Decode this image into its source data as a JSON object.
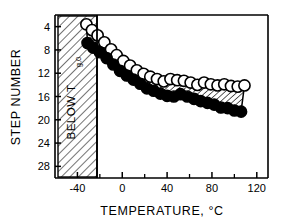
{
  "chart_data": {
    "type": "scatter",
    "title": "",
    "xlabel": "TEMPERATURE, °C",
    "ylabel": "STEP NUMBER",
    "xlim": [
      -60,
      130
    ],
    "ylim": [
      30,
      2
    ],
    "y_axis_inverted": true,
    "grid": false,
    "legend": "none",
    "xticks": [
      -40,
      0,
      40,
      80,
      120
    ],
    "xtick_labels": [
      "-40",
      "0",
      "40",
      "80",
      "120"
    ],
    "xticks_minor": [
      -20,
      20,
      60,
      100
    ],
    "yticks": [
      4,
      8,
      12,
      16,
      20,
      24,
      28
    ],
    "ytick_labels": [
      "4",
      "8",
      "12",
      "16",
      "20",
      "24",
      "28"
    ],
    "annotations": [
      {
        "text": "BELOW T",
        "subscript": "g,0",
        "orientation": "vertical",
        "region": "hatched",
        "x_range": [
          -60,
          -40
        ]
      }
    ],
    "series": [
      {
        "name": "upper-bound-open-circles",
        "marker": "open-circle",
        "x": [
          -32,
          -27,
          -22,
          -16,
          -10,
          -5,
          1,
          7,
          13,
          19,
          25,
          31,
          37,
          43,
          49,
          55,
          61,
          67,
          73,
          79,
          85,
          91,
          97,
          103,
          109
        ],
        "y": [
          3.6,
          4.6,
          5.5,
          6.7,
          7.9,
          8.9,
          9.9,
          10.7,
          11.5,
          12.1,
          12.6,
          13.0,
          13.4,
          13.0,
          13.2,
          13.3,
          13.6,
          14.0,
          13.6,
          13.9,
          14.1,
          13.9,
          14.2,
          14.3,
          14.1
        ]
      },
      {
        "name": "lower-bound-filled-circles",
        "marker": "filled-circle",
        "x": [
          -31,
          -26,
          -20,
          -14,
          -8,
          -2,
          4,
          10,
          16,
          22,
          28,
          34,
          40,
          46,
          52,
          58,
          64,
          70,
          76,
          82,
          88,
          94,
          100,
          106
        ],
        "y": [
          6.8,
          7.6,
          8.4,
          9.4,
          10.5,
          11.6,
          12.4,
          13.1,
          13.8,
          14.6,
          15.0,
          15.5,
          15.9,
          16.0,
          15.6,
          16.0,
          16.4,
          16.8,
          17.1,
          17.4,
          17.9,
          18.0,
          18.4,
          18.6
        ]
      }
    ],
    "band": {
      "style": "hatched",
      "description": "hatched band between upper open-circle curve and lower filled-circle curve"
    }
  }
}
